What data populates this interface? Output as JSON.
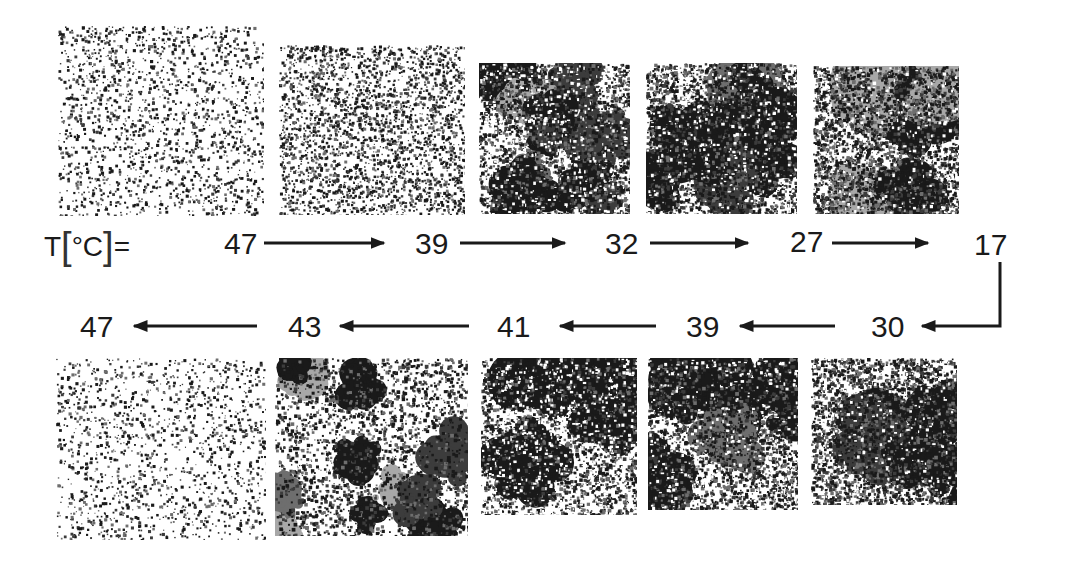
{
  "figure": {
    "temperature_label": {
      "prefix": "T",
      "open_bracket": "[",
      "unit": "°C",
      "close_bracket": "]",
      "equals": "="
    },
    "cooling_row": {
      "direction": "left-to-right",
      "temperatures": [
        "47",
        "39",
        "32",
        "27",
        "17"
      ],
      "panels": [
        {
          "temperature": "47",
          "ordered_fraction": 0.12,
          "domain_size": "very small"
        },
        {
          "temperature": "39",
          "ordered_fraction": 0.45,
          "domain_size": "small"
        },
        {
          "temperature": "32",
          "ordered_fraction": 0.65,
          "domain_size": "medium"
        },
        {
          "temperature": "27",
          "ordered_fraction": 0.75,
          "domain_size": "medium-large"
        },
        {
          "temperature": "17",
          "ordered_fraction": 0.88,
          "domain_size": "large"
        }
      ]
    },
    "heating_row": {
      "direction": "right-to-left",
      "temperatures": [
        "30",
        "39",
        "41",
        "43",
        "47"
      ],
      "panels": [
        {
          "temperature": "30",
          "ordered_fraction": 0.85,
          "domain_size": "large"
        },
        {
          "temperature": "39",
          "ordered_fraction": 0.75,
          "domain_size": "large"
        },
        {
          "temperature": "41",
          "ordered_fraction": 0.55,
          "domain_size": "large"
        },
        {
          "temperature": "43",
          "ordered_fraction": 0.3,
          "domain_size": "medium"
        },
        {
          "temperature": "47",
          "ordered_fraction": 0.06,
          "domain_size": "very small"
        }
      ]
    },
    "palette": {
      "background": "#ffffff",
      "ink": "#1a1a1a",
      "gray_dark": "#3c3c3c",
      "gray_mid": "#6e6e6e",
      "gray_light": "#a8a8a8",
      "gray_pale": "#d8d8d8"
    }
  }
}
